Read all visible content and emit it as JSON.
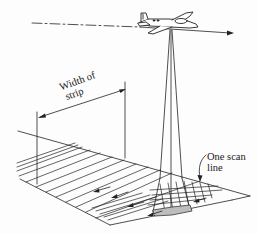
{
  "diagram": {
    "labels": {
      "width_of_strip_line1": "Width of",
      "width_of_strip_line2": "strip",
      "one_scan_line_line1": "One scan",
      "one_scan_line_line2": "line"
    },
    "colors": {
      "ink": "#222222",
      "background": "#fdfdfd",
      "footprint_fill": "#bdbdbd"
    }
  }
}
